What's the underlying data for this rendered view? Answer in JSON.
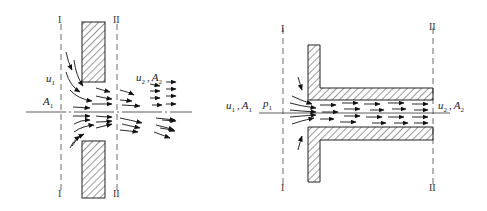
{
  "figure_left": {
    "title": "Orifice (sharp-edged hole in thin wall)",
    "section_labels": {
      "I_top": "I",
      "I_bottom": "I",
      "II_top": "II",
      "II_bottom": "II"
    },
    "inlet_velocity": {
      "symbol": "u",
      "sub": "1"
    },
    "inlet_area": {
      "symbol": "A",
      "sub": "1"
    },
    "outlet_velocity": {
      "symbol": "u",
      "sub": "2"
    },
    "outlet_area": {
      "symbol": "A",
      "sub": "2"
    },
    "separator": ","
  },
  "figure_right": {
    "title": "Short tube (re-entrant nozzle)",
    "section_labels": {
      "I_top": "I",
      "I_bottom": "I",
      "II_top": "II",
      "II_bottom": "II"
    },
    "inlet_velocity": {
      "symbol": "u",
      "sub": "1"
    },
    "inlet_area": {
      "symbol": "A",
      "sub": "1"
    },
    "inlet_pressure": {
      "symbol": "p",
      "sub": "1"
    },
    "outlet_velocity": {
      "symbol": "u",
      "sub": "2"
    },
    "outlet_area": {
      "symbol": "A",
      "sub": "2"
    },
    "separator": ","
  },
  "colors": {
    "line": "#222222",
    "hatch": "#333333",
    "background": "#ffffff"
  }
}
